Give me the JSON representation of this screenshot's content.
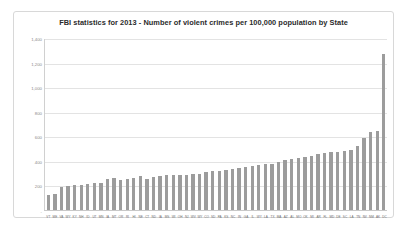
{
  "chart_data": {
    "type": "bar",
    "title": "FBI statistics for 2013 - Number of violent crimes per 100,000 population by State",
    "xlabel": "",
    "ylabel": "",
    "ylim": [
      0,
      1400
    ],
    "yticks": [
      0,
      200,
      400,
      600,
      800,
      1000,
      1200,
      1400
    ],
    "ytick_labels": [
      "-",
      "200",
      "400",
      "600",
      "800",
      "1,000",
      "1,200",
      "1,400"
    ],
    "grid": true,
    "legend": false,
    "bar_color": "#9c9c9c",
    "categories": [
      "VT",
      "ME",
      "VA",
      "WY",
      "KY",
      "NH",
      "ID",
      "UT",
      "MN",
      "IA",
      "MT",
      "OR",
      "RI",
      "HI",
      "NE",
      "CT",
      "ND",
      "IA",
      "MS",
      "WI",
      "OH",
      "NJ",
      "WV",
      "WY",
      "CO",
      "SD",
      "PA",
      "KS",
      "NC",
      "IN",
      "GA",
      "IL",
      "WY",
      "LA",
      "TX",
      "MA",
      "AZ",
      "AL",
      "MO",
      "OK",
      "MI",
      "AR",
      "FL",
      "MD",
      "DE",
      "SC",
      "LA",
      "TN",
      "NV",
      "NM",
      "AK",
      "DC"
    ],
    "values": [
      121,
      128,
      190,
      194,
      200,
      201,
      212,
      216,
      223,
      253,
      259,
      248,
      252,
      261,
      280,
      256,
      266,
      274,
      282,
      283,
      285,
      289,
      293,
      296,
      309,
      316,
      320,
      329,
      331,
      339,
      352,
      360,
      366,
      371,
      378,
      387,
      405,
      412,
      425,
      430,
      441,
      452,
      468,
      471,
      475,
      478,
      490,
      518,
      589,
      635,
      640,
      1270
    ],
    "max_value": 1270,
    "min_value": 121,
    "sorted": "ascending"
  },
  "chart": {
    "title": "FBI statistics for 2013 - Number of violent crimes per 100,000 population by State"
  }
}
